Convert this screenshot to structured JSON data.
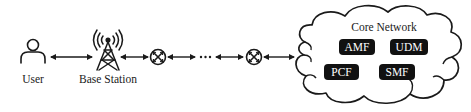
{
  "diagram": {
    "type": "network-architecture",
    "nodes": {
      "user": {
        "label": "User",
        "icon": "user-icon"
      },
      "base_station": {
        "label": "Base Station",
        "icon": "cell-tower-icon"
      },
      "router_1": {
        "label": "",
        "icon": "router-icon"
      },
      "ellipsis": {
        "label": "···"
      },
      "router_2": {
        "label": "",
        "icon": "router-icon"
      }
    },
    "core_network": {
      "title": "Core Network",
      "icon": "cloud-icon",
      "functions": [
        {
          "label": "AMF"
        },
        {
          "label": "UDM"
        },
        {
          "label": "PCF"
        },
        {
          "label": "SMF"
        }
      ]
    },
    "connections": [
      {
        "from": "User",
        "to": "Base Station",
        "type": "bidirectional-arrow"
      },
      {
        "from": "Base Station",
        "to": "Router 1",
        "type": "bidirectional-arrow"
      },
      {
        "from": "Router 1",
        "to": "···",
        "type": "bidirectional-arrow"
      },
      {
        "from": "···",
        "to": "Router 2",
        "type": "bidirectional-arrow"
      },
      {
        "from": "Router 2",
        "to": "Core Network",
        "type": "bidirectional-arrow"
      }
    ],
    "colors": {
      "stroke": "#1a1a1a",
      "nf_box_fill": "#111111",
      "nf_box_text": "#ffffff",
      "background": "#ffffff"
    }
  }
}
